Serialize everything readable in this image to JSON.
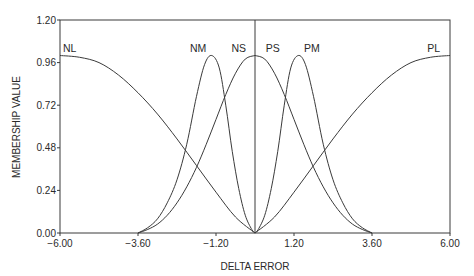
{
  "chart_data": {
    "type": "line",
    "title": "",
    "xlabel": "DELTA ERROR",
    "ylabel": "MEMBERSHIP VALUE",
    "xlim": [
      -6.0,
      6.0
    ],
    "ylim": [
      0.0,
      1.2
    ],
    "grid": false,
    "legend": "none (series labeled inline above peaks)",
    "x_ticks": [
      -6.0,
      -3.6,
      -1.2,
      1.2,
      3.6,
      6.0
    ],
    "x_tick_labels": [
      "−6.00",
      "−3.60",
      "−1.20",
      "1.20",
      "3.60",
      "6.00"
    ],
    "y_ticks": [
      0.0,
      0.24,
      0.48,
      0.72,
      0.96,
      1.2
    ],
    "y_tick_labels": [
      "0.00",
      "0.24",
      "0.48",
      "0.72",
      "0.96",
      "1.20"
    ],
    "vertical_reference_line_x": 0.0,
    "series": [
      {
        "name": "NL",
        "label_pos": [
          -5.7,
          1.02
        ],
        "x": [
          -6.0,
          -5.4,
          -4.8,
          -4.2,
          -3.6,
          -3.0,
          -2.4,
          -1.8,
          -1.2,
          -0.6,
          0.0
        ],
        "values": [
          1.0,
          0.99,
          0.96,
          0.89,
          0.79,
          0.67,
          0.53,
          0.38,
          0.23,
          0.09,
          0.0
        ]
      },
      {
        "name": "NM",
        "label_pos": [
          -1.75,
          1.02
        ],
        "x": [
          -3.6,
          -3.3,
          -3.0,
          -2.7,
          -2.4,
          -2.1,
          -1.8,
          -1.55,
          -1.33,
          -1.1,
          -0.9,
          -0.7,
          -0.5,
          -0.3,
          -0.1,
          0.0
        ],
        "values": [
          0.0,
          0.03,
          0.08,
          0.17,
          0.3,
          0.5,
          0.77,
          0.95,
          1.0,
          0.93,
          0.72,
          0.46,
          0.25,
          0.1,
          0.02,
          0.0
        ]
      },
      {
        "name": "NS",
        "label_pos": [
          -0.5,
          1.02
        ],
        "x": [
          -3.6,
          -3.3,
          -3.0,
          -2.7,
          -2.4,
          -2.1,
          -1.8,
          -1.5,
          -1.2,
          -0.9,
          -0.6,
          -0.3,
          0.0
        ],
        "values": [
          0.0,
          0.02,
          0.05,
          0.1,
          0.17,
          0.26,
          0.37,
          0.5,
          0.64,
          0.78,
          0.9,
          0.98,
          1.0
        ]
      },
      {
        "name": "PS",
        "label_pos": [
          0.55,
          1.02
        ],
        "x": [
          0.0,
          0.3,
          0.6,
          0.9,
          1.2,
          1.5,
          1.8,
          2.1,
          2.4,
          2.7,
          3.0,
          3.3,
          3.6
        ],
        "values": [
          1.0,
          0.98,
          0.9,
          0.78,
          0.64,
          0.5,
          0.37,
          0.26,
          0.17,
          0.1,
          0.05,
          0.02,
          0.0
        ]
      },
      {
        "name": "PM",
        "label_pos": [
          1.75,
          1.02
        ],
        "x": [
          0.0,
          0.1,
          0.3,
          0.5,
          0.7,
          0.9,
          1.1,
          1.33,
          1.55,
          1.8,
          2.1,
          2.4,
          2.7,
          3.0,
          3.3,
          3.6
        ],
        "values": [
          0.0,
          0.02,
          0.1,
          0.25,
          0.46,
          0.72,
          0.93,
          1.0,
          0.95,
          0.77,
          0.5,
          0.3,
          0.17,
          0.08,
          0.03,
          0.0
        ]
      },
      {
        "name": "PL",
        "label_pos": [
          5.5,
          1.02
        ],
        "x": [
          0.0,
          0.6,
          1.2,
          1.8,
          2.4,
          3.0,
          3.6,
          4.2,
          4.8,
          5.4,
          6.0
        ],
        "values": [
          0.0,
          0.09,
          0.23,
          0.38,
          0.53,
          0.67,
          0.79,
          0.89,
          0.96,
          0.99,
          1.0
        ]
      }
    ]
  }
}
